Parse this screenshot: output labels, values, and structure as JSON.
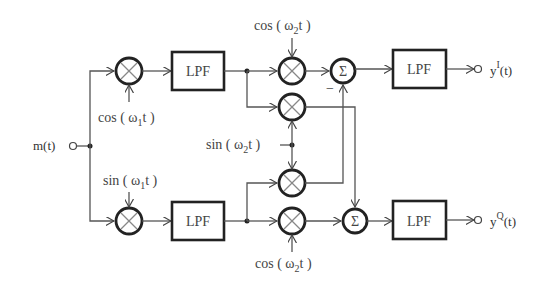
{
  "diagram": {
    "title": "",
    "input": {
      "label": "m(t)"
    },
    "outputs": [
      {
        "label_base": "y",
        "label_sup": "I",
        "label_tail": "(t)"
      },
      {
        "label_base": "y",
        "label_sup": "Q",
        "label_tail": "(t)"
      }
    ],
    "blocks": {
      "lpf": "LPF",
      "sum": "Σ",
      "multiply": "⊗"
    },
    "carriers": {
      "cos_w1": {
        "pre": "cos ( ω",
        "sub": "1",
        "post": "t )"
      },
      "sin_w1": {
        "pre": "sin ( ω",
        "sub": "1",
        "post": "t )"
      },
      "cos_w2_top": {
        "pre": "cos ( ω",
        "sub": "2",
        "post": "t )"
      },
      "sin_w2": {
        "pre": "sin ( ω",
        "sub": "2",
        "post": "t )"
      },
      "cos_w2_bottom": {
        "pre": "cos ( ω",
        "sub": "2",
        "post": "t )"
      }
    },
    "sign_minus": "−",
    "colors": {
      "stroke": "#222222",
      "wire": "#555555",
      "text": "#444444"
    }
  }
}
